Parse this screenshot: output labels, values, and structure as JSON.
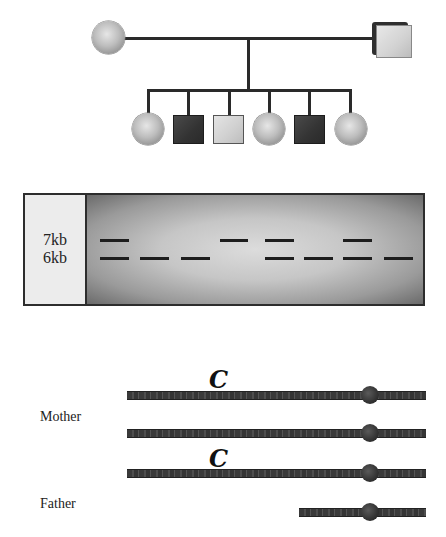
{
  "pedigree": {
    "parents": [
      {
        "role": "mother",
        "sex": "female",
        "affected": false
      },
      {
        "role": "father",
        "sex": "male",
        "affected": false
      }
    ],
    "children": [
      {
        "sex": "female",
        "affected": false
      },
      {
        "sex": "male",
        "affected": true
      },
      {
        "sex": "male",
        "affected": false
      },
      {
        "sex": "female",
        "affected": false
      },
      {
        "sex": "male",
        "affected": true
      },
      {
        "sex": "female",
        "affected": false
      }
    ]
  },
  "gel": {
    "labels": [
      "7kb",
      "6kb"
    ],
    "lanes": [
      {
        "subject": "mother",
        "bands": [
          "7kb",
          "6kb"
        ]
      },
      {
        "subject": "father",
        "bands": [
          "6kb"
        ]
      },
      {
        "subject": "child-1-female",
        "bands": [
          "6kb"
        ]
      },
      {
        "subject": "child-2-male-affected",
        "bands": [
          "7kb"
        ]
      },
      {
        "subject": "child-3-male",
        "bands": [
          "7kb",
          "6kb"
        ]
      },
      {
        "subject": "child-4-female",
        "bands": [
          "6kb"
        ]
      },
      {
        "subject": "child-5-male-affected",
        "bands": [
          "7kb",
          "6kb"
        ]
      },
      {
        "subject": "child-6-female",
        "bands": [
          "6kb"
        ]
      }
    ]
  },
  "chromosomes": {
    "mother_label": "Mother",
    "father_label": "Father",
    "marker": "C"
  }
}
